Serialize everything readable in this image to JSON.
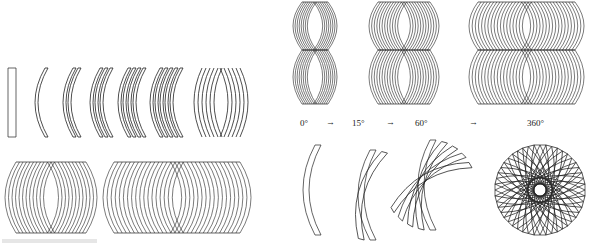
{
  "figure": {
    "left_panel": {
      "top_row_sequence": [
        "strip",
        "1 arc",
        "2 arcs",
        "3 arcs",
        "4 arcs",
        "5 arcs",
        "mirrored arcs"
      ],
      "bottom_row": [
        "dense bowl pattern small",
        "dense bowl pattern wide"
      ]
    },
    "right_panel": {
      "top_row": [
        "double bowl narrow",
        "double bowl medium",
        "double bowl wide"
      ],
      "rotation_labels": [
        "0°",
        "15°",
        "60°",
        "360°"
      ],
      "arrow_glyph": "→"
    },
    "colors": {
      "stroke": "#222222",
      "background": "#ffffff"
    }
  }
}
